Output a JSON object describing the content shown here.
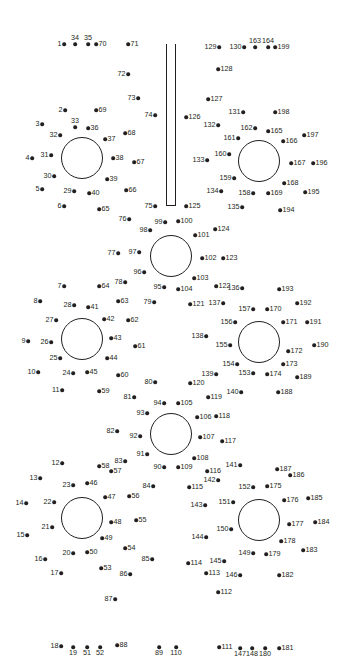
{
  "puzzle": {
    "title": "",
    "ink_color": "#231f20",
    "background": "#ffffff",
    "shapes": [
      {
        "type": "circle",
        "name": "circle-top-left",
        "cx": 82,
        "cy": 158,
        "r": 21
      },
      {
        "type": "circle",
        "name": "circle-top-right",
        "cx": 259,
        "cy": 161,
        "r": 21
      },
      {
        "type": "circle",
        "name": "circle-center-upper",
        "cx": 171,
        "cy": 256,
        "r": 21
      },
      {
        "type": "circle",
        "name": "circle-mid-left",
        "cx": 82,
        "cy": 339,
        "r": 21
      },
      {
        "type": "circle",
        "name": "circle-mid-right",
        "cx": 259,
        "cy": 342,
        "r": 21
      },
      {
        "type": "circle",
        "name": "circle-center-lower",
        "cx": 171,
        "cy": 434,
        "r": 21
      },
      {
        "type": "circle",
        "name": "circle-bottom-left",
        "cx": 82,
        "cy": 518,
        "r": 21
      },
      {
        "type": "circle",
        "name": "circle-bottom-right",
        "cx": 259,
        "cy": 520,
        "r": 21
      },
      {
        "type": "rect",
        "name": "stem",
        "x": 166,
        "y": 44,
        "w": 10,
        "h": 162
      }
    ],
    "dots": [
      {
        "n": "1",
        "x": 64,
        "y": 44,
        "p": "l"
      },
      {
        "n": "2",
        "x": 65,
        "y": 110,
        "p": "l"
      },
      {
        "n": "3",
        "x": 42,
        "y": 124,
        "p": "l"
      },
      {
        "n": "4",
        "x": 32,
        "y": 158,
        "p": "l"
      },
      {
        "n": "5",
        "x": 42,
        "y": 189,
        "p": "l"
      },
      {
        "n": "6",
        "x": 64,
        "y": 206,
        "p": "l"
      },
      {
        "n": "7",
        "x": 64,
        "y": 286,
        "p": "l"
      },
      {
        "n": "8",
        "x": 40,
        "y": 301,
        "p": "l"
      },
      {
        "n": "9",
        "x": 28,
        "y": 341,
        "p": "l"
      },
      {
        "n": "10",
        "x": 38,
        "y": 372,
        "p": "l"
      },
      {
        "n": "11",
        "x": 62,
        "y": 390,
        "p": "l"
      },
      {
        "n": "12",
        "x": 62,
        "y": 463,
        "p": "l"
      },
      {
        "n": "13",
        "x": 40,
        "y": 478,
        "p": "l"
      },
      {
        "n": "14",
        "x": 26,
        "y": 503,
        "p": "l"
      },
      {
        "n": "15",
        "x": 27,
        "y": 535,
        "p": "l"
      },
      {
        "n": "16",
        "x": 45,
        "y": 559,
        "p": "l"
      },
      {
        "n": "17",
        "x": 61,
        "y": 573,
        "p": "l"
      },
      {
        "n": "18",
        "x": 61,
        "y": 646,
        "p": "l"
      },
      {
        "n": "19",
        "x": 73,
        "y": 647,
        "p": "b"
      },
      {
        "n": "20",
        "x": 73,
        "y": 553,
        "p": "l"
      },
      {
        "n": "21",
        "x": 52,
        "y": 527,
        "p": "l"
      },
      {
        "n": "22",
        "x": 54,
        "y": 502,
        "p": "l"
      },
      {
        "n": "23",
        "x": 73,
        "y": 485,
        "p": "l"
      },
      {
        "n": "24",
        "x": 73,
        "y": 373,
        "p": "l"
      },
      {
        "n": "25",
        "x": 60,
        "y": 358,
        "p": "l"
      },
      {
        "n": "26",
        "x": 51,
        "y": 342,
        "p": "l"
      },
      {
        "n": "27",
        "x": 56,
        "y": 320,
        "p": "l"
      },
      {
        "n": "28",
        "x": 74,
        "y": 305,
        "p": "l"
      },
      {
        "n": "29",
        "x": 74,
        "y": 191,
        "p": "l"
      },
      {
        "n": "30",
        "x": 54,
        "y": 176,
        "p": "l"
      },
      {
        "n": "31",
        "x": 51,
        "y": 155,
        "p": "l"
      },
      {
        "n": "32",
        "x": 60,
        "y": 135,
        "p": "l"
      },
      {
        "n": "33",
        "x": 75,
        "y": 127,
        "p": "t"
      },
      {
        "n": "34",
        "x": 75,
        "y": 44,
        "p": "t"
      },
      {
        "n": "35",
        "x": 88,
        "y": 44,
        "p": "t"
      },
      {
        "n": "36",
        "x": 88,
        "y": 128,
        "p": "r"
      },
      {
        "n": "37",
        "x": 105,
        "y": 139,
        "p": "r"
      },
      {
        "n": "38",
        "x": 113,
        "y": 158,
        "p": "r"
      },
      {
        "n": "39",
        "x": 107,
        "y": 179,
        "p": "r"
      },
      {
        "n": "40",
        "x": 89,
        "y": 193,
        "p": "r"
      },
      {
        "n": "41",
        "x": 88,
        "y": 307,
        "p": "r"
      },
      {
        "n": "42",
        "x": 104,
        "y": 319,
        "p": "r"
      },
      {
        "n": "43",
        "x": 111,
        "y": 338,
        "p": "r"
      },
      {
        "n": "44",
        "x": 107,
        "y": 358,
        "p": "r"
      },
      {
        "n": "45",
        "x": 87,
        "y": 372,
        "p": "r"
      },
      {
        "n": "46",
        "x": 87,
        "y": 483,
        "p": "r"
      },
      {
        "n": "47",
        "x": 105,
        "y": 497,
        "p": "r"
      },
      {
        "n": "48",
        "x": 111,
        "y": 522,
        "p": "r"
      },
      {
        "n": "49",
        "x": 102,
        "y": 538,
        "p": "r"
      },
      {
        "n": "50",
        "x": 87,
        "y": 552,
        "p": "r"
      },
      {
        "n": "51",
        "x": 87,
        "y": 647,
        "p": "b"
      },
      {
        "n": "52",
        "x": 100,
        "y": 647,
        "p": "b"
      },
      {
        "n": "53",
        "x": 101,
        "y": 568,
        "p": "r"
      },
      {
        "n": "54",
        "x": 125,
        "y": 548,
        "p": "r"
      },
      {
        "n": "55",
        "x": 136,
        "y": 520,
        "p": "r"
      },
      {
        "n": "56",
        "x": 129,
        "y": 496,
        "p": "r"
      },
      {
        "n": "57",
        "x": 111,
        "y": 471,
        "p": "r"
      },
      {
        "n": "58",
        "x": 99,
        "y": 466,
        "p": "r"
      },
      {
        "n": "59",
        "x": 99,
        "y": 391,
        "p": "r"
      },
      {
        "n": "60",
        "x": 118,
        "y": 375,
        "p": "r"
      },
      {
        "n": "61",
        "x": 135,
        "y": 346,
        "p": "r"
      },
      {
        "n": "62",
        "x": 128,
        "y": 320,
        "p": "r"
      },
      {
        "n": "63",
        "x": 118,
        "y": 301,
        "p": "r"
      },
      {
        "n": "64",
        "x": 99,
        "y": 286,
        "p": "r"
      },
      {
        "n": "65",
        "x": 99,
        "y": 209,
        "p": "r"
      },
      {
        "n": "66",
        "x": 126,
        "y": 190,
        "p": "r"
      },
      {
        "n": "67",
        "x": 134,
        "y": 162,
        "p": "r"
      },
      {
        "n": "68",
        "x": 125,
        "y": 133,
        "p": "r"
      },
      {
        "n": "69",
        "x": 96,
        "y": 110,
        "p": "r"
      },
      {
        "n": "70",
        "x": 96,
        "y": 44,
        "p": "r"
      },
      {
        "n": "71",
        "x": 128,
        "y": 44,
        "p": "r"
      },
      {
        "n": "72",
        "x": 128,
        "y": 74,
        "p": "l"
      },
      {
        "n": "73",
        "x": 138,
        "y": 98,
        "p": "l"
      },
      {
        "n": "74",
        "x": 155,
        "y": 115,
        "p": "l"
      },
      {
        "n": "75",
        "x": 155,
        "y": 206,
        "p": "l"
      },
      {
        "n": "76",
        "x": 129,
        "y": 219,
        "p": "l"
      },
      {
        "n": "77",
        "x": 118,
        "y": 253,
        "p": "l"
      },
      {
        "n": "78",
        "x": 125,
        "y": 282,
        "p": "l"
      },
      {
        "n": "79",
        "x": 154,
        "y": 302,
        "p": "l"
      },
      {
        "n": "80",
        "x": 155,
        "y": 382,
        "p": "l"
      },
      {
        "n": "81",
        "x": 134,
        "y": 397,
        "p": "l"
      },
      {
        "n": "82",
        "x": 117,
        "y": 431,
        "p": "l"
      },
      {
        "n": "83",
        "x": 125,
        "y": 461,
        "p": "l"
      },
      {
        "n": "84",
        "x": 153,
        "y": 486,
        "p": "l"
      },
      {
        "n": "85",
        "x": 152,
        "y": 559,
        "p": "l"
      },
      {
        "n": "86",
        "x": 130,
        "y": 574,
        "p": "l"
      },
      {
        "n": "87",
        "x": 115,
        "y": 599,
        "p": "l"
      },
      {
        "n": "88",
        "x": 117,
        "y": 645,
        "p": "r"
      },
      {
        "n": "89",
        "x": 159,
        "y": 647,
        "p": "b"
      },
      {
        "n": "90",
        "x": 164,
        "y": 467,
        "p": "l"
      },
      {
        "n": "91",
        "x": 147,
        "y": 454,
        "p": "l"
      },
      {
        "n": "92",
        "x": 140,
        "y": 436,
        "p": "l"
      },
      {
        "n": "93",
        "x": 147,
        "y": 413,
        "p": "l"
      },
      {
        "n": "94",
        "x": 164,
        "y": 403,
        "p": "l"
      },
      {
        "n": "95",
        "x": 164,
        "y": 287,
        "p": "l"
      },
      {
        "n": "96",
        "x": 144,
        "y": 272,
        "p": "l"
      },
      {
        "n": "97",
        "x": 139,
        "y": 252,
        "p": "l"
      },
      {
        "n": "98",
        "x": 150,
        "y": 230,
        "p": "l"
      },
      {
        "n": "99",
        "x": 165,
        "y": 222,
        "p": "l"
      },
      {
        "n": "100",
        "x": 178,
        "y": 221,
        "p": "r"
      },
      {
        "n": "101",
        "x": 195,
        "y": 235,
        "p": "r"
      },
      {
        "n": "102",
        "x": 202,
        "y": 258,
        "p": "r"
      },
      {
        "n": "103",
        "x": 194,
        "y": 278,
        "p": "r"
      },
      {
        "n": "104",
        "x": 178,
        "y": 289,
        "p": "r"
      },
      {
        "n": "105",
        "x": 178,
        "y": 403,
        "p": "r"
      },
      {
        "n": "106",
        "x": 197,
        "y": 417,
        "p": "r"
      },
      {
        "n": "107",
        "x": 200,
        "y": 437,
        "p": "r"
      },
      {
        "n": "108",
        "x": 194,
        "y": 458,
        "p": "r"
      },
      {
        "n": "109",
        "x": 178,
        "y": 467,
        "p": "r"
      },
      {
        "n": "110",
        "x": 176,
        "y": 647,
        "p": "b"
      },
      {
        "n": "111",
        "x": 219,
        "y": 647,
        "p": "r"
      },
      {
        "n": "112",
        "x": 218,
        "y": 592,
        "p": "r"
      },
      {
        "n": "113",
        "x": 206,
        "y": 573,
        "p": "r"
      },
      {
        "n": "114",
        "x": 188,
        "y": 563,
        "p": "r"
      },
      {
        "n": "115",
        "x": 189,
        "y": 487,
        "p": "r"
      },
      {
        "n": "116",
        "x": 207,
        "y": 471,
        "p": "r"
      },
      {
        "n": "117",
        "x": 222,
        "y": 441,
        "p": "r"
      },
      {
        "n": "118",
        "x": 216,
        "y": 416,
        "p": "r"
      },
      {
        "n": "119",
        "x": 208,
        "y": 397,
        "p": "r"
      },
      {
        "n": "120",
        "x": 190,
        "y": 383,
        "p": "r"
      },
      {
        "n": "121",
        "x": 190,
        "y": 304,
        "p": "r"
      },
      {
        "n": "122",
        "x": 216,
        "y": 286,
        "p": "r"
      },
      {
        "n": "123",
        "x": 223,
        "y": 258,
        "p": "r"
      },
      {
        "n": "124",
        "x": 215,
        "y": 229,
        "p": "r"
      },
      {
        "n": "125",
        "x": 186,
        "y": 206,
        "p": "r"
      },
      {
        "n": "126",
        "x": 186,
        "y": 117,
        "p": "r"
      },
      {
        "n": "127",
        "x": 208,
        "y": 99,
        "p": "r"
      },
      {
        "n": "128",
        "x": 218,
        "y": 69,
        "p": "r"
      },
      {
        "n": "129",
        "x": 219,
        "y": 47,
        "p": "l"
      },
      {
        "n": "130",
        "x": 244,
        "y": 47,
        "p": "l"
      },
      {
        "n": "131",
        "x": 243,
        "y": 112,
        "p": "l"
      },
      {
        "n": "132",
        "x": 218,
        "y": 125,
        "p": "l"
      },
      {
        "n": "133",
        "x": 207,
        "y": 160,
        "p": "l"
      },
      {
        "n": "134",
        "x": 221,
        "y": 191,
        "p": "l"
      },
      {
        "n": "135",
        "x": 242,
        "y": 207,
        "p": "l"
      },
      {
        "n": "136",
        "x": 242,
        "y": 288,
        "p": "l"
      },
      {
        "n": "137",
        "x": 223,
        "y": 303,
        "p": "l"
      },
      {
        "n": "138",
        "x": 206,
        "y": 336,
        "p": "l"
      },
      {
        "n": "139",
        "x": 216,
        "y": 374,
        "p": "l"
      },
      {
        "n": "140",
        "x": 241,
        "y": 392,
        "p": "l"
      },
      {
        "n": "141",
        "x": 240,
        "y": 465,
        "p": "l"
      },
      {
        "n": "142",
        "x": 218,
        "y": 480,
        "p": "l"
      },
      {
        "n": "143",
        "x": 205,
        "y": 505,
        "p": "l"
      },
      {
        "n": "144",
        "x": 206,
        "y": 537,
        "p": "l"
      },
      {
        "n": "145",
        "x": 224,
        "y": 561,
        "p": "l"
      },
      {
        "n": "146",
        "x": 240,
        "y": 575,
        "p": "l"
      },
      {
        "n": "147",
        "x": 240,
        "y": 648,
        "p": "b"
      },
      {
        "n": "148",
        "x": 252,
        "y": 648,
        "p": "b"
      },
      {
        "n": "149",
        "x": 253,
        "y": 553,
        "p": "l"
      },
      {
        "n": "150",
        "x": 231,
        "y": 529,
        "p": "l"
      },
      {
        "n": "151",
        "x": 233,
        "y": 502,
        "p": "l"
      },
      {
        "n": "152",
        "x": 253,
        "y": 487,
        "p": "l"
      },
      {
        "n": "153",
        "x": 253,
        "y": 373,
        "p": "l"
      },
      {
        "n": "154",
        "x": 237,
        "y": 364,
        "p": "l"
      },
      {
        "n": "155",
        "x": 230,
        "y": 345,
        "p": "l"
      },
      {
        "n": "156",
        "x": 235,
        "y": 322,
        "p": "l"
      },
      {
        "n": "157",
        "x": 253,
        "y": 309,
        "p": "l"
      },
      {
        "n": "158",
        "x": 253,
        "y": 193,
        "p": "l"
      },
      {
        "n": "159",
        "x": 234,
        "y": 178,
        "p": "l"
      },
      {
        "n": "160",
        "x": 229,
        "y": 154,
        "p": "l"
      },
      {
        "n": "161",
        "x": 238,
        "y": 138,
        "p": "l"
      },
      {
        "n": "162",
        "x": 255,
        "y": 128,
        "p": "l"
      },
      {
        "n": "163",
        "x": 255,
        "y": 47,
        "p": "t"
      },
      {
        "n": "164",
        "x": 268,
        "y": 47,
        "p": "t"
      },
      {
        "n": "165",
        "x": 268,
        "y": 131,
        "p": "r"
      },
      {
        "n": "166",
        "x": 283,
        "y": 141,
        "p": "r"
      },
      {
        "n": "167",
        "x": 291,
        "y": 163,
        "p": "r"
      },
      {
        "n": "168",
        "x": 284,
        "y": 183,
        "p": "r"
      },
      {
        "n": "169",
        "x": 268,
        "y": 193,
        "p": "r"
      },
      {
        "n": "170",
        "x": 267,
        "y": 309,
        "p": "r"
      },
      {
        "n": "171",
        "x": 283,
        "y": 322,
        "p": "r"
      },
      {
        "n": "172",
        "x": 288,
        "y": 351,
        "p": "r"
      },
      {
        "n": "173",
        "x": 283,
        "y": 364,
        "p": "r"
      },
      {
        "n": "174",
        "x": 267,
        "y": 374,
        "p": "r"
      },
      {
        "n": "175",
        "x": 267,
        "y": 486,
        "p": "r"
      },
      {
        "n": "176",
        "x": 284,
        "y": 500,
        "p": "r"
      },
      {
        "n": "177",
        "x": 289,
        "y": 524,
        "p": "r"
      },
      {
        "n": "178",
        "x": 281,
        "y": 541,
        "p": "r"
      },
      {
        "n": "179",
        "x": 266,
        "y": 554,
        "p": "r"
      },
      {
        "n": "180",
        "x": 265,
        "y": 648,
        "p": "b"
      },
      {
        "n": "181",
        "x": 279,
        "y": 648,
        "p": "r"
      },
      {
        "n": "182",
        "x": 279,
        "y": 575,
        "p": "r"
      },
      {
        "n": "183",
        "x": 303,
        "y": 550,
        "p": "r"
      },
      {
        "n": "184",
        "x": 315,
        "y": 522,
        "p": "r"
      },
      {
        "n": "185",
        "x": 308,
        "y": 498,
        "p": "r"
      },
      {
        "n": "186",
        "x": 290,
        "y": 475,
        "p": "r"
      },
      {
        "n": "187",
        "x": 277,
        "y": 469,
        "p": "r"
      },
      {
        "n": "188",
        "x": 278,
        "y": 392,
        "p": "r"
      },
      {
        "n": "189",
        "x": 297,
        "y": 377,
        "p": "r"
      },
      {
        "n": "190",
        "x": 314,
        "y": 345,
        "p": "r"
      },
      {
        "n": "191",
        "x": 307,
        "y": 322,
        "p": "r"
      },
      {
        "n": "192",
        "x": 297,
        "y": 303,
        "p": "r"
      },
      {
        "n": "193",
        "x": 279,
        "y": 289,
        "p": "r"
      },
      {
        "n": "194",
        "x": 280,
        "y": 210,
        "p": "r"
      },
      {
        "n": "195",
        "x": 305,
        "y": 192,
        "p": "r"
      },
      {
        "n": "196",
        "x": 313,
        "y": 163,
        "p": "r"
      },
      {
        "n": "197",
        "x": 304,
        "y": 135,
        "p": "r"
      },
      {
        "n": "198",
        "x": 275,
        "y": 112,
        "p": "r"
      },
      {
        "n": "199",
        "x": 275,
        "y": 47,
        "p": "r"
      }
    ]
  }
}
